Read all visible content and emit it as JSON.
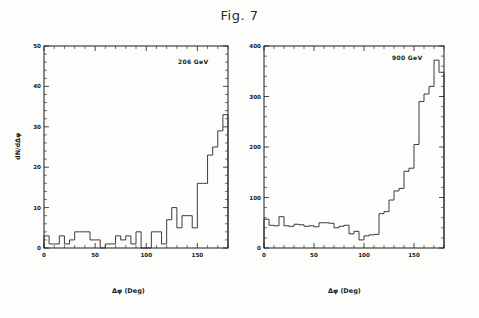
{
  "figure": {
    "title": "Fig. 7"
  },
  "panels": [
    {
      "id": "left",
      "annotation": "206 GeV",
      "xlabel": "Δφ (Deg)",
      "ylabel": "dN/dΔφ",
      "xticks": [
        "0",
        "50",
        "100",
        "150"
      ],
      "yticks": [
        "0",
        "10",
        "20",
        "30",
        "40",
        "50"
      ]
    },
    {
      "id": "right",
      "annotation": "900 GeV",
      "xlabel": "Δφ (Deg)",
      "ylabel": "",
      "xticks": [
        "0",
        "50",
        "100",
        "150"
      ],
      "yticks": [
        "0",
        "100",
        "200",
        "300",
        "400"
      ]
    }
  ],
  "chart_data": [
    {
      "type": "bar",
      "title": "206 GeV",
      "xlabel": "Δφ (Deg)",
      "ylabel": "dN/dΔφ",
      "xlim": [
        0,
        180
      ],
      "ylim": [
        0,
        50
      ],
      "xticks": [
        0,
        50,
        100,
        150
      ],
      "yticks": [
        0,
        10,
        20,
        30,
        40,
        50
      ],
      "grid": false,
      "legend": "none",
      "bin_width": 5,
      "bin_edges": [
        0,
        5,
        10,
        15,
        20,
        25,
        30,
        35,
        40,
        45,
        50,
        55,
        60,
        65,
        70,
        75,
        80,
        85,
        90,
        95,
        100,
        105,
        110,
        115,
        120,
        125,
        130,
        135,
        140,
        145,
        150,
        155,
        160,
        165,
        170,
        175,
        180
      ],
      "categories": [
        "0-5",
        "5-10",
        "10-15",
        "15-20",
        "20-25",
        "25-30",
        "30-35",
        "35-40",
        "40-45",
        "45-50",
        "50-55",
        "55-60",
        "60-65",
        "65-70",
        "70-75",
        "75-80",
        "80-85",
        "85-90",
        "90-95",
        "95-100",
        "100-105",
        "105-110",
        "110-115",
        "115-120",
        "120-125",
        "125-130",
        "130-135",
        "135-140",
        "140-145",
        "145-150",
        "150-155",
        "155-160",
        "160-165",
        "165-170",
        "170-175",
        "175-180"
      ],
      "values": [
        3,
        1,
        1,
        3,
        1,
        2,
        4,
        4,
        4,
        2,
        2,
        0,
        1,
        1,
        3,
        2,
        3,
        1,
        4,
        0,
        0,
        4,
        4,
        1,
        7,
        10,
        5,
        8,
        8,
        5,
        16,
        16,
        23,
        25,
        29,
        33,
        33
      ]
    },
    {
      "type": "bar",
      "title": "900 GeV",
      "xlabel": "Δφ (Deg)",
      "ylabel": "",
      "xlim": [
        0,
        180
      ],
      "ylim": [
        0,
        400
      ],
      "xticks": [
        0,
        50,
        100,
        150
      ],
      "yticks": [
        0,
        100,
        200,
        300,
        400
      ],
      "grid": false,
      "legend": "none",
      "bin_width": 5,
      "bin_edges": [
        0,
        5,
        10,
        15,
        20,
        25,
        30,
        35,
        40,
        45,
        50,
        55,
        60,
        65,
        70,
        75,
        80,
        85,
        90,
        95,
        100,
        105,
        110,
        115,
        120,
        125,
        130,
        135,
        140,
        145,
        150,
        155,
        160,
        165,
        170,
        175,
        180
      ],
      "categories": [
        "0-5",
        "5-10",
        "10-15",
        "15-20",
        "20-25",
        "25-30",
        "30-35",
        "35-40",
        "40-45",
        "45-50",
        "50-55",
        "55-60",
        "60-65",
        "65-70",
        "70-75",
        "75-80",
        "80-85",
        "85-90",
        "90-95",
        "95-100",
        "100-105",
        "105-110",
        "110-115",
        "115-120",
        "120-125",
        "125-130",
        "130-135",
        "135-140",
        "140-145",
        "145-150",
        "150-155",
        "155-160",
        "160-165",
        "165-170",
        "170-175",
        "175-180"
      ],
      "values": [
        57,
        45,
        44,
        62,
        44,
        43,
        47,
        46,
        43,
        44,
        42,
        50,
        50,
        49,
        40,
        43,
        45,
        28,
        33,
        16,
        24,
        26,
        27,
        68,
        72,
        95,
        113,
        118,
        152,
        158,
        205,
        290,
        305,
        320,
        372,
        348,
        340
      ]
    }
  ],
  "colors": {
    "line": "#262626",
    "axis": "#1a1a1a",
    "background": "#fdfdfb"
  }
}
